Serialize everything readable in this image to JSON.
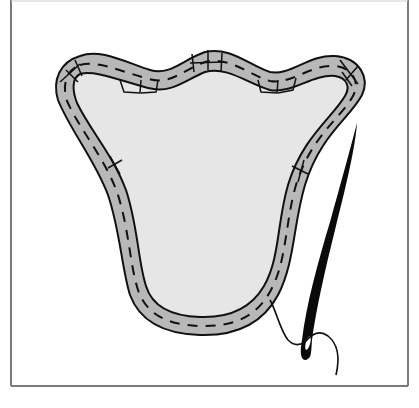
{
  "illustration": {
    "subject": "Hand-stitching an appliqué shape with needle and thread",
    "elements": [
      "frame",
      "appliqué-shape",
      "seam-allowance-band",
      "running-stitches",
      "tack-stitches",
      "needle",
      "thread"
    ]
  },
  "colors": {
    "background": "#ffffff",
    "frame": "#7a7a7a",
    "band_fill": "#b8b8b8",
    "inner_fill": "#e6e6e6",
    "outline": "#111111",
    "needle": "#0a0a0a"
  }
}
